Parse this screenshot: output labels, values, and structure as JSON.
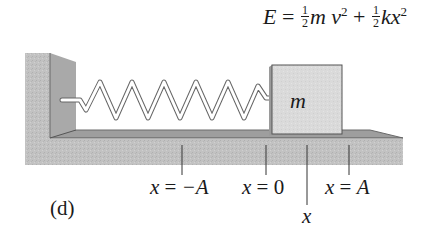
{
  "figure": {
    "panel_label": "(d)",
    "equation": {
      "lhs": "E",
      "equals": "=",
      "term1": {
        "frac_num": "1",
        "frac_den": "2",
        "vars": "m",
        "var2": "v",
        "exp": "2"
      },
      "plus": "+",
      "term2": {
        "frac_num": "1",
        "frac_den": "2",
        "vars": "k",
        "var2": "x",
        "exp": "2"
      },
      "text": "E = ½ m v² + ½ k x²"
    },
    "mass": {
      "label": "m"
    },
    "markers": [
      {
        "name": "x-neg-A",
        "var": "x",
        "eq": " = ",
        "val": "−A"
      },
      {
        "name": "x-zero",
        "var": "x",
        "eq": " = ",
        "val": "0"
      },
      {
        "name": "x-pos-A",
        "var": "x",
        "eq": " = ",
        "val": "A"
      }
    ],
    "position_label": "x",
    "colors": {
      "wall_face": "#b8b8b8",
      "wall_side": "#a3a3a3",
      "floor_top": "#9a9a9a",
      "floor_front": "#c4c4c4",
      "block": "#dcdcdc",
      "spring": "#ffffff",
      "stroke": "#555555"
    }
  }
}
